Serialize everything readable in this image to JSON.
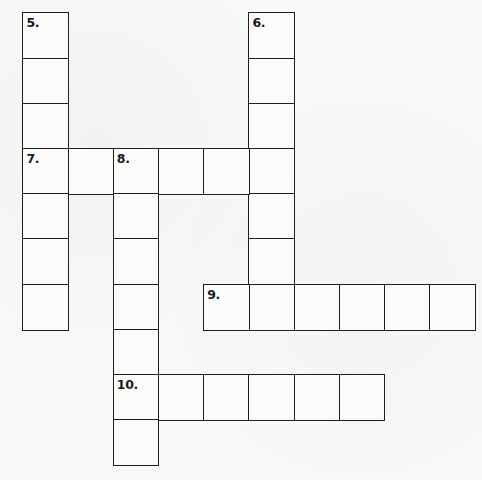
{
  "puzzle": {
    "type": "crossword",
    "grid_origin": {
      "x": 23,
      "y": 13
    },
    "cell_size": 45.2,
    "line_color": "#1e1e1e",
    "background_color": "#f8f8f7",
    "words": [
      {
        "number": "5.",
        "label": "5.",
        "direction": "down",
        "row": 0,
        "col": 0,
        "length": 7
      },
      {
        "number": "6.",
        "label": "6.",
        "direction": "down",
        "row": 0,
        "col": 5,
        "length": 7
      },
      {
        "number": "7.",
        "label": "7.",
        "direction": "across",
        "row": 3,
        "col": 0,
        "length": 6
      },
      {
        "number": "8.",
        "label": "8.",
        "direction": "down",
        "row": 3,
        "col": 2,
        "length": 7
      },
      {
        "number": "9.",
        "label": "9.",
        "direction": "across",
        "row": 6,
        "col": 4,
        "length": 6
      },
      {
        "number": "10.",
        "label": "10.",
        "direction": "across",
        "row": 8,
        "col": 2,
        "length": 6
      }
    ]
  }
}
